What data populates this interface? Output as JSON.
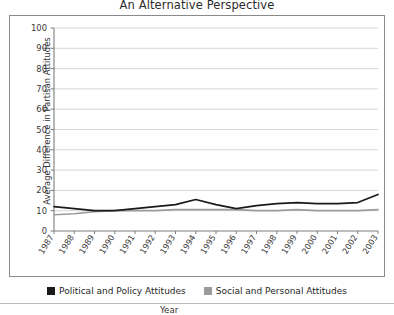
{
  "chart_data": {
    "type": "line",
    "title": "An Alternative Perspective",
    "xlabel": "Year",
    "ylabel": "Average  Difference in Partisan Attitudes",
    "categories": [
      "1987",
      "1988",
      "1989",
      "1990",
      "1991",
      "1992",
      "1993",
      "1994",
      "1995",
      "1996",
      "1997",
      "1998",
      "1999",
      "2000",
      "2001",
      "2002",
      "2003"
    ],
    "x": [
      1987,
      1988,
      1989,
      1990,
      1991,
      1992,
      1993,
      1994,
      1995,
      1996,
      1997,
      1998,
      1999,
      2000,
      2001,
      2002,
      2003
    ],
    "ylim": [
      0,
      100
    ],
    "xlim": [
      1987,
      2003
    ],
    "yticks": [
      0,
      10,
      20,
      30,
      40,
      50,
      60,
      70,
      80,
      90,
      100
    ],
    "grid": true,
    "grid_axis": "y",
    "legend_position": "bottom",
    "series": [
      {
        "name": "Political and Policy Attitudes",
        "color": "#1a1a1a",
        "values": [
          12,
          11,
          10,
          10,
          11,
          12,
          13,
          15.5,
          13,
          11,
          12.5,
          13.5,
          14,
          13.5,
          13.5,
          14,
          18
        ]
      },
      {
        "name": "Social and Personal Attitudes",
        "color": "#9b9b9b",
        "values": [
          8,
          8.5,
          9.5,
          10,
          10,
          10,
          10.5,
          10.5,
          10.5,
          10.5,
          10,
          10,
          10.5,
          10,
          10,
          10,
          10.5
        ]
      }
    ]
  },
  "legend": {
    "entries": [
      {
        "label": "Political and Policy Attitudes",
        "color": "#1a1a1a"
      },
      {
        "label": "Social and Personal Attitudes",
        "color": "#9b9b9b"
      }
    ]
  },
  "colors": {
    "series_political": "#1a1a1a",
    "series_social": "#9b9b9b",
    "grid": "#d6d6d6",
    "axis": "#7d7d7d",
    "frame": "#8a8a8a",
    "text": "#2b2b2b"
  }
}
